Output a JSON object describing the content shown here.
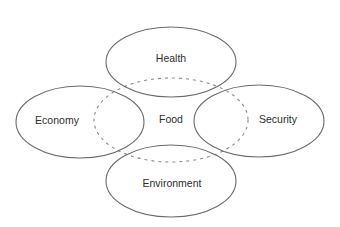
{
  "diagram": {
    "type": "overlapping-ellipses",
    "colors": {
      "outline": "#6a6a6a",
      "dashed_outline": "#8a8a8a",
      "text": "#2e2e2e",
      "background": "#ffffff"
    },
    "center": {
      "label": "Food",
      "style": "dashed",
      "cx": 171,
      "cy": 120,
      "rx": 77,
      "ry": 42
    },
    "nodes": [
      {
        "id": "health",
        "label": "Health",
        "position": "top",
        "cx": 171,
        "cy": 62,
        "rx": 65,
        "ry": 35
      },
      {
        "id": "economy",
        "label": "Economy",
        "position": "left",
        "cx": 80,
        "cy": 122,
        "rx": 64,
        "ry": 36
      },
      {
        "id": "security",
        "label": "Security",
        "position": "right",
        "cx": 259,
        "cy": 121,
        "rx": 65,
        "ry": 36
      },
      {
        "id": "environment",
        "label": "Environment",
        "position": "bottom",
        "cx": 171,
        "cy": 181,
        "rx": 65,
        "ry": 36
      }
    ],
    "label_positions": {
      "health": {
        "x": 171,
        "y": 59
      },
      "economy": {
        "x": 57,
        "y": 121
      },
      "security": {
        "x": 278,
        "y": 120
      },
      "environment": {
        "x": 172,
        "y": 184
      },
      "food": {
        "x": 171,
        "y": 120
      }
    }
  }
}
